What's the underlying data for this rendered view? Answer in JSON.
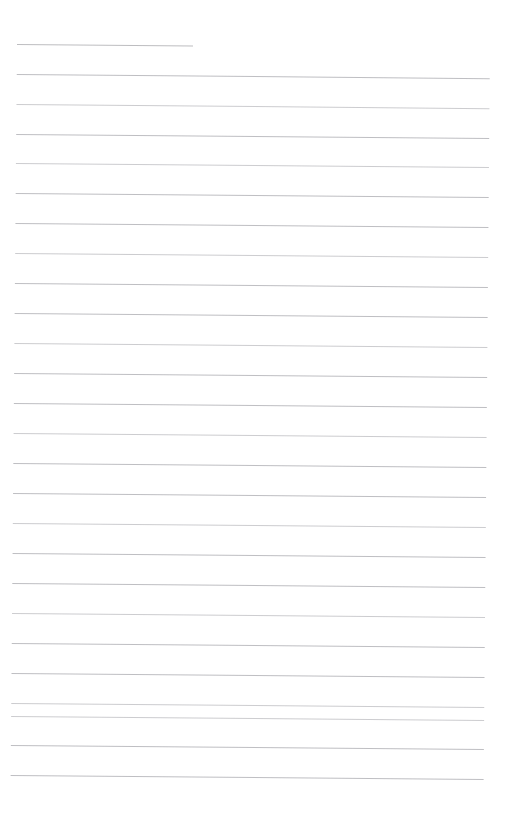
{
  "document": {
    "kind": "lined-paper",
    "title": "Blank ruled notebook page",
    "page_width": 512,
    "page_height": 817,
    "background_color": "#ffffff",
    "rule_color": "#b9b9bd",
    "rule_thickness_px": 1,
    "rule_spacing_px": 30,
    "left_margin_px": 17,
    "right_margin_px": 22,
    "first_rule_y_px": 44,
    "last_rule_y_px": 775,
    "bottom_blank_space_px": 42,
    "skew_degrees": 0.5,
    "rule_count": 26,
    "written_text": "",
    "notes": "Page is empty; no handwriting, headings, or printed characters are present."
  },
  "rules": [
    {
      "index": 1,
      "y": 44,
      "x_start": 17,
      "x_end": 193,
      "full_width": false,
      "faint": false
    },
    {
      "index": 2,
      "y": 74,
      "x_start": 17,
      "x_end": 490,
      "full_width": true,
      "faint": false
    },
    {
      "index": 3,
      "y": 104,
      "x_start": 17,
      "x_end": 490,
      "full_width": true,
      "faint": true
    },
    {
      "index": 4,
      "y": 134,
      "x_start": 17,
      "x_end": 490,
      "full_width": true,
      "faint": false
    },
    {
      "index": 5,
      "y": 163,
      "x_start": 17,
      "x_end": 490,
      "full_width": true,
      "faint": true
    },
    {
      "index": 6,
      "y": 193,
      "x_start": 17,
      "x_end": 490,
      "full_width": true,
      "faint": false
    },
    {
      "index": 7,
      "y": 223,
      "x_start": 17,
      "x_end": 490,
      "full_width": true,
      "faint": false
    },
    {
      "index": 8,
      "y": 253,
      "x_start": 17,
      "x_end": 490,
      "full_width": true,
      "faint": true
    },
    {
      "index": 9,
      "y": 283,
      "x_start": 17,
      "x_end": 490,
      "full_width": true,
      "faint": false
    },
    {
      "index": 10,
      "y": 313,
      "x_start": 17,
      "x_end": 490,
      "full_width": true,
      "faint": false
    },
    {
      "index": 11,
      "y": 343,
      "x_start": 17,
      "x_end": 490,
      "full_width": true,
      "faint": true
    },
    {
      "index": 12,
      "y": 373,
      "x_start": 17,
      "x_end": 490,
      "full_width": true,
      "faint": false
    },
    {
      "index": 13,
      "y": 403,
      "x_start": 17,
      "x_end": 490,
      "full_width": true,
      "faint": false
    },
    {
      "index": 14,
      "y": 433,
      "x_start": 17,
      "x_end": 490,
      "full_width": true,
      "faint": true
    },
    {
      "index": 15,
      "y": 463,
      "x_start": 17,
      "x_end": 490,
      "full_width": true,
      "faint": false
    },
    {
      "index": 16,
      "y": 493,
      "x_start": 17,
      "x_end": 490,
      "full_width": true,
      "faint": false
    },
    {
      "index": 17,
      "y": 523,
      "x_start": 17,
      "x_end": 490,
      "full_width": true,
      "faint": true
    },
    {
      "index": 18,
      "y": 553,
      "x_start": 17,
      "x_end": 490,
      "full_width": true,
      "faint": false
    },
    {
      "index": 19,
      "y": 583,
      "x_start": 17,
      "x_end": 490,
      "full_width": true,
      "faint": false
    },
    {
      "index": 20,
      "y": 613,
      "x_start": 17,
      "x_end": 490,
      "full_width": true,
      "faint": true
    },
    {
      "index": 21,
      "y": 643,
      "x_start": 17,
      "x_end": 490,
      "full_width": true,
      "faint": false
    },
    {
      "index": 22,
      "y": 673,
      "x_start": 17,
      "x_end": 490,
      "full_width": true,
      "faint": false
    },
    {
      "index": 23,
      "y": 703,
      "x_start": 17,
      "x_end": 490,
      "full_width": true,
      "faint": true
    },
    {
      "index": 24,
      "y": 716,
      "x_start": 17,
      "x_end": 490,
      "full_width": true,
      "faint": true
    },
    {
      "index": 25,
      "y": 745,
      "x_start": 17,
      "x_end": 490,
      "full_width": true,
      "faint": false
    },
    {
      "index": 26,
      "y": 775,
      "x_start": 17,
      "x_end": 490,
      "full_width": true,
      "faint": false
    }
  ]
}
